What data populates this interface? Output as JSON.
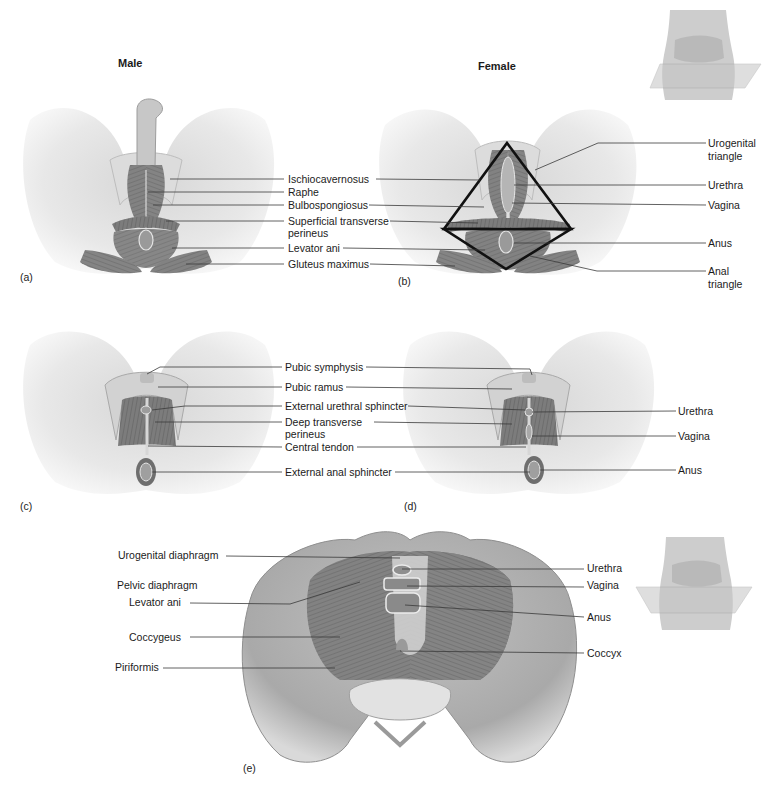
{
  "figure": {
    "headers": {
      "male": "Male",
      "female": "Female"
    },
    "panels": {
      "a": "(a)",
      "b": "(b)",
      "c": "(c)",
      "d": "(d)",
      "e": "(e)"
    },
    "panel_a_labels": {
      "ischiocavernosus": "Ischiocavernosus",
      "raphe": "Raphe",
      "bulbospongiosus": "Bulbospongiosus",
      "superficial_transverse_1": "Superficial transverse",
      "superficial_transverse_2": "perineus",
      "levator_ani": "Levator ani",
      "gluteus_maximus": "Gluteus maximus"
    },
    "panel_b_labels": {
      "urogenital_triangle_1": "Urogenital",
      "urogenital_triangle_2": "triangle",
      "urethra": "Urethra",
      "vagina": "Vagina",
      "anus": "Anus",
      "anal_triangle_1": "Anal",
      "anal_triangle_2": "triangle"
    },
    "panel_cd_labels": {
      "pubic_symphysis": "Pubic symphysis",
      "pubic_ramus": "Pubic ramus",
      "external_urethral_sphincter": "External urethral sphincter",
      "deep_transverse_1": "Deep transverse",
      "deep_transverse_2": "perineus",
      "central_tendon": "Central tendon",
      "external_anal_sphincter": "External anal sphincter"
    },
    "panel_d_labels": {
      "urethra": "Urethra",
      "vagina": "Vagina",
      "anus": "Anus"
    },
    "panel_e_labels": {
      "urogenital_diaphragm": "Urogenital diaphragm",
      "pelvic_diaphragm": "Pelvic diaphragm",
      "levator_ani": "Levator ani",
      "coccygeus": "Coccygeus",
      "piriformis": "Piriformis",
      "urethra": "Urethra",
      "vagina": "Vagina",
      "anus": "Anus",
      "coccyx": "Coccyx"
    },
    "colors": {
      "background": "#ffffff",
      "skin_light": "#e9e9e9",
      "skin_mid": "#c9c9c9",
      "muscle": "#8a8a8a",
      "muscle_dark": "#5e5e5e",
      "bone": "#d8d8d8",
      "leader_line": "#3a3a3a",
      "triangle_outline": "#111111",
      "text": "#1b1b1b"
    }
  }
}
